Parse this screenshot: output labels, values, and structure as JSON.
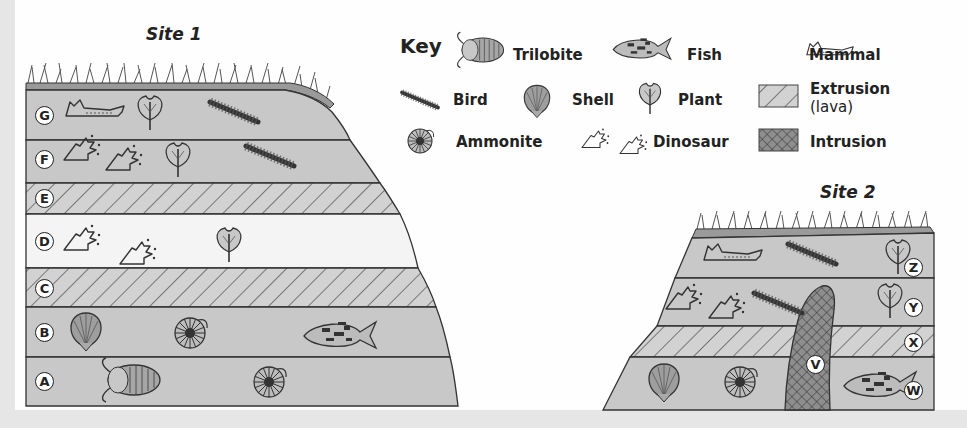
{
  "diagram": {
    "type": "geologic cross-section with fossils",
    "site1": {
      "title": "Site 1",
      "layers": [
        {
          "label": "G",
          "type": "sedimentary",
          "fossils": [
            "mammal",
            "plant",
            "bird"
          ]
        },
        {
          "label": "F",
          "type": "sedimentary",
          "fossils": [
            "dinosaur",
            "dinosaur",
            "plant",
            "bird"
          ]
        },
        {
          "label": "E",
          "type": "extrusion (lava)",
          "fossils": []
        },
        {
          "label": "D",
          "type": "sedimentary (light)",
          "fossils": [
            "dinosaur",
            "dinosaur",
            "plant"
          ]
        },
        {
          "label": "C",
          "type": "extrusion (lava)",
          "fossils": []
        },
        {
          "label": "B",
          "type": "sedimentary",
          "fossils": [
            "shell",
            "ammonite",
            "fish"
          ]
        },
        {
          "label": "A",
          "type": "sedimentary",
          "fossils": [
            "trilobite",
            "ammonite"
          ]
        }
      ]
    },
    "site2": {
      "title": "Site 2",
      "layers": [
        {
          "label": "Z",
          "type": "sedimentary",
          "fossils": [
            "mammal",
            "bird",
            "plant"
          ]
        },
        {
          "label": "Y",
          "type": "sedimentary",
          "fossils": [
            "dinosaur",
            "dinosaur",
            "bird",
            "plant"
          ]
        },
        {
          "label": "X",
          "type": "extrusion (lava)",
          "fossils": []
        },
        {
          "label": "W",
          "type": "sedimentary",
          "fossils": [
            "shell",
            "ammonite",
            "fish"
          ]
        }
      ],
      "intrusion": {
        "label": "V",
        "type": "intrusion"
      }
    },
    "key": {
      "title": "Key",
      "items": [
        {
          "icon": "trilobite-icon",
          "label": "Trilobite"
        },
        {
          "icon": "fish-icon",
          "label": "Fish"
        },
        {
          "icon": "mammal-icon",
          "label": "Mammal"
        },
        {
          "icon": "bird-feather-icon",
          "label": "Bird"
        },
        {
          "icon": "shell-icon",
          "label": "Shell"
        },
        {
          "icon": "plant-icon",
          "label": "Plant"
        },
        {
          "icon": "extrusion-hatch-swatch",
          "label": "Extrusion",
          "label2": "(lava)"
        },
        {
          "icon": "ammonite-icon",
          "label": "Ammonite"
        },
        {
          "icon": "dinosaur-footprint-icon",
          "label": "Dinosaur"
        },
        {
          "icon": "intrusion-crosshatch-swatch",
          "label": "Intrusion"
        }
      ]
    },
    "colors": {
      "sediment": "#c9c9c9",
      "sediment_light": "#f2f2f2",
      "lava_bg": "#cfcfcf",
      "intrusion": "#8a8a8a",
      "outline": "#333333",
      "background": "#fefefe"
    }
  }
}
